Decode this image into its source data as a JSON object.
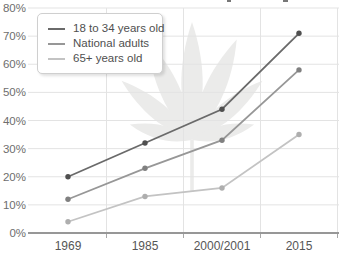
{
  "chart_data": {
    "type": "line",
    "title": "",
    "categories": [
      "1969",
      "1985",
      "2000/2001",
      "2015"
    ],
    "series": [
      {
        "name": "18 to 34 years old",
        "values": [
          20,
          32,
          44,
          71
        ],
        "color": "#6a6a6a",
        "point_color": "#4f4f4f"
      },
      {
        "name": "National adults",
        "values": [
          12,
          23,
          33,
          58
        ],
        "color": "#979797",
        "point_color": "#808080"
      },
      {
        "name": "65+ years old",
        "values": [
          4,
          13,
          16,
          35
        ],
        "color": "#c3c3c3",
        "point_color": "#aeaeae"
      }
    ],
    "y_ticks": [
      "0%",
      "10%",
      "20%",
      "30%",
      "40%",
      "50%",
      "60%",
      "70%",
      "80%"
    ],
    "xlabel": "",
    "ylabel": "",
    "ylim": [
      0,
      80
    ],
    "grid": true,
    "legend_position": "top-left",
    "watermark": "cannabis-leaf",
    "style": {
      "grid_color": "#e3e3e3",
      "axis_color": "#979797",
      "tick_color": "#a8a8a8",
      "y_label_color": "#6e6e6e",
      "x_label_color": "#565656",
      "watermark_color": "#ebebea",
      "background": "#ffffff"
    }
  }
}
